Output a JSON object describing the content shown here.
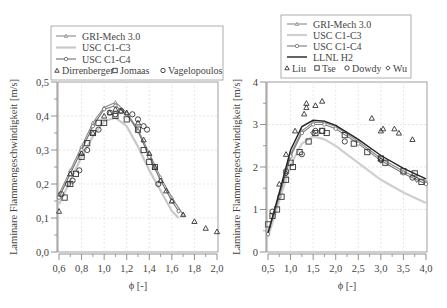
{
  "chart_data": [
    {
      "type": "line",
      "title": "",
      "xlabel": "ϕ [-]",
      "ylabel": "Laminare Flammengeschwindigkeit [m/s]",
      "xlim": [
        0.6,
        2.0
      ],
      "ylim": [
        0.0,
        0.5
      ],
      "xticks": [
        "0,6",
        "0,8",
        "1,0",
        "1,2",
        "1,4",
        "1,6",
        "1,8",
        "2,0"
      ],
      "yticks": [
        "0,0",
        "0,1",
        "0,2",
        "0,3",
        "0,4",
        "0,5"
      ],
      "grid": true,
      "legend_position": "top",
      "legend": [
        "GRI-Mech 3.0",
        "USC C1-C3",
        "USC C1-C4",
        "Dirrenberger",
        "Jomaas",
        "Vagelopoulos"
      ],
      "series": [
        {
          "name": "GRI-Mech 3.0",
          "kind": "line",
          "marker": "triangle",
          "color": "#8a8a8a",
          "x": [
            0.6,
            0.7,
            0.8,
            0.9,
            1.0,
            1.1,
            1.2,
            1.3,
            1.4,
            1.5,
            1.6,
            1.7
          ],
          "y": [
            0.17,
            0.24,
            0.31,
            0.38,
            0.425,
            0.44,
            0.41,
            0.36,
            0.29,
            0.22,
            0.16,
            0.11
          ]
        },
        {
          "name": "USC C1-C3",
          "kind": "line",
          "marker": "none",
          "color": "#c8c8c8",
          "x": [
            0.6,
            0.7,
            0.8,
            0.9,
            1.0,
            1.1,
            1.2,
            1.3,
            1.4,
            1.5,
            1.6,
            1.66
          ],
          "y": [
            0.14,
            0.21,
            0.28,
            0.34,
            0.385,
            0.395,
            0.37,
            0.31,
            0.24,
            0.18,
            0.12,
            0.1
          ]
        },
        {
          "name": "USC C1-C4",
          "kind": "line",
          "marker": "circle",
          "color": "#6f6f6f",
          "x": [
            0.6,
            0.7,
            0.8,
            0.9,
            1.0,
            1.1,
            1.2,
            1.3,
            1.4,
            1.5,
            1.6,
            1.66
          ],
          "y": [
            0.16,
            0.23,
            0.3,
            0.37,
            0.42,
            0.43,
            0.405,
            0.355,
            0.28,
            0.21,
            0.15,
            0.12
          ]
        },
        {
          "name": "Dirrenberger",
          "kind": "scatter",
          "marker": "triangle",
          "x": [
            0.6,
            0.7,
            0.8,
            0.9,
            1.0,
            1.05,
            1.1,
            1.15,
            1.2,
            1.3,
            1.35,
            1.4,
            1.45,
            1.5,
            1.55,
            1.6,
            1.7,
            1.8,
            1.9,
            2.0
          ],
          "y": [
            0.12,
            0.23,
            0.29,
            0.35,
            0.4,
            0.41,
            0.42,
            0.415,
            0.41,
            0.38,
            0.33,
            0.29,
            0.25,
            0.21,
            0.18,
            0.15,
            0.11,
            0.09,
            0.07,
            0.06
          ]
        },
        {
          "name": "Jomaas",
          "kind": "scatter",
          "marker": "square",
          "x": [
            0.65,
            0.7,
            0.75,
            0.8,
            0.85,
            0.9,
            0.95,
            1.0,
            1.1,
            1.2,
            1.3,
            1.35,
            1.4,
            1.45
          ],
          "y": [
            0.16,
            0.2,
            0.23,
            0.28,
            0.32,
            0.35,
            0.38,
            0.38,
            0.4,
            0.39,
            0.36,
            0.3,
            0.265,
            0.25
          ]
        },
        {
          "name": "Vagelopoulos",
          "kind": "scatter",
          "marker": "circle",
          "x": [
            0.62,
            0.68,
            0.72,
            0.78,
            0.85,
            0.95,
            1.05,
            1.1,
            1.15,
            1.25,
            1.3,
            1.35,
            1.38,
            1.48
          ],
          "y": [
            0.17,
            0.2,
            0.21,
            0.24,
            0.3,
            0.36,
            0.41,
            0.405,
            0.415,
            0.405,
            0.39,
            0.37,
            0.36,
            0.2
          ]
        }
      ]
    },
    {
      "type": "line",
      "title": "",
      "xlabel": "ϕ [-]",
      "ylabel": "Laminare Flammengeschwindigkeit [m/s]",
      "xlim": [
        0.5,
        4.0
      ],
      "ylim": [
        0,
        4
      ],
      "xticks": [
        "0,5",
        "1,0",
        "1,5",
        "2,0",
        "2,5",
        "3,0",
        "3,5",
        "4,0"
      ],
      "yticks": [
        "0",
        "1",
        "2",
        "3",
        "4"
      ],
      "grid": true,
      "legend_position": "top",
      "legend": [
        "GRI-Mech 3.0",
        "USC C1-C3",
        "USC C1-C4",
        "LLNL H2",
        "Liu",
        "Tse",
        "Dowdy",
        "Wu"
      ],
      "series": [
        {
          "name": "GRI-Mech 3.0",
          "kind": "line",
          "marker": "triangle",
          "color": "#8a8a8a",
          "x": [
            0.5,
            0.75,
            1.0,
            1.25,
            1.5,
            1.75,
            2.0,
            2.5,
            3.0,
            3.5,
            4.0
          ],
          "y": [
            0.45,
            1.35,
            2.3,
            2.85,
            3.05,
            3.05,
            2.95,
            2.6,
            2.2,
            1.9,
            1.65
          ]
        },
        {
          "name": "USC C1-C3",
          "kind": "line",
          "marker": "none",
          "color": "#cfcfcf",
          "x": [
            0.5,
            0.75,
            1.0,
            1.25,
            1.5,
            1.75,
            2.0,
            2.5,
            3.0,
            3.5,
            4.0
          ],
          "y": [
            0.35,
            1.2,
            2.05,
            2.55,
            2.72,
            2.65,
            2.5,
            2.1,
            1.7,
            1.4,
            1.15
          ]
        },
        {
          "name": "USC C1-C4",
          "kind": "line",
          "marker": "circle",
          "color": "#7a7a7a",
          "x": [
            0.5,
            0.75,
            1.0,
            1.25,
            1.5,
            1.75,
            2.0,
            2.5,
            3.0,
            3.5,
            4.0
          ],
          "y": [
            0.42,
            1.3,
            2.25,
            2.8,
            3.0,
            3.0,
            2.9,
            2.55,
            2.15,
            1.85,
            1.6
          ]
        },
        {
          "name": "LLNL H2",
          "kind": "line",
          "marker": "none",
          "color": "#222222",
          "x": [
            0.5,
            0.75,
            1.0,
            1.25,
            1.5,
            1.75,
            2.0,
            2.5,
            3.0,
            3.5,
            4.0
          ],
          "y": [
            0.45,
            1.4,
            2.4,
            2.95,
            3.1,
            3.08,
            2.98,
            2.65,
            2.27,
            1.97,
            1.72
          ]
        },
        {
          "name": "Liu",
          "kind": "scatter",
          "marker": "triangle",
          "x": [
            0.75,
            0.9,
            1.1,
            1.3,
            1.35,
            1.35,
            1.55,
            1.7,
            2.8,
            3.0,
            3.05,
            3.3,
            3.4,
            3.7
          ],
          "y": [
            1.6,
            2.3,
            2.85,
            3.25,
            3.4,
            3.5,
            3.45,
            3.55,
            3.15,
            2.85,
            2.9,
            2.9,
            2.8,
            2.65
          ]
        },
        {
          "name": "Tse",
          "kind": "scatter",
          "marker": "square",
          "x": [
            0.5,
            0.6,
            0.7,
            0.8,
            0.9,
            1.0,
            1.05,
            1.2,
            1.4,
            1.55,
            1.7,
            1.8,
            2.2,
            2.4,
            2.7,
            3.0,
            3.1,
            3.5,
            3.75,
            3.9
          ],
          "y": [
            0.65,
            0.85,
            1.0,
            1.3,
            1.7,
            2.1,
            2.0,
            2.35,
            2.6,
            2.8,
            2.85,
            2.8,
            2.75,
            2.55,
            2.35,
            2.2,
            2.1,
            1.9,
            1.85,
            1.65
          ]
        },
        {
          "name": "Dowdy",
          "kind": "scatter",
          "marker": "circle",
          "x": [
            0.6,
            0.9,
            1.25,
            1.55,
            1.7,
            2.2,
            3.0,
            3.7
          ],
          "y": [
            0.95,
            1.9,
            2.3,
            2.85,
            2.85,
            2.6,
            2.2,
            1.75
          ]
        },
        {
          "name": "Wu",
          "kind": "scatter",
          "marker": "diamond",
          "x": [
            0.9,
            1.5,
            3.0,
            3.8
          ],
          "y": [
            1.85,
            2.8,
            2.15,
            1.7
          ]
        }
      ]
    }
  ],
  "charts": {
    "left": {
      "legend": {
        "lines": [
          "GRI-Mech 3.0",
          "USC C1-C3",
          "USC C1-C4"
        ],
        "markers": [
          "Dirrenberger",
          "Jomaas",
          "Vagelopoulos"
        ]
      },
      "ylabel": "Laminare Flammengeschwindigkeit [m/s]",
      "xlabel": "ϕ [-]",
      "yticks": [
        "0,0",
        "0,1",
        "0,2",
        "0,3",
        "0,4",
        "0,5"
      ],
      "xticks": [
        "0,6",
        "0,8",
        "1,0",
        "1,2",
        "1,4",
        "1,6",
        "1,8",
        "2,0"
      ]
    },
    "right": {
      "legend": {
        "lines": [
          "GRI-Mech 3.0",
          "USC C1-C3",
          "USC C1-C4",
          "LLNL H2"
        ],
        "markers": [
          "Liu",
          "Tse",
          "Dowdy",
          "Wu"
        ]
      },
      "ylabel": "Laminare Flammengeschwindigkeit [m/s]",
      "xlabel": "ϕ [-]",
      "yticks": [
        "0",
        "1",
        "2",
        "3",
        "4"
      ],
      "xticks": [
        "0,5",
        "1,0",
        "1,5",
        "2,0",
        "2,5",
        "3,0",
        "3,5",
        "4,0"
      ]
    }
  }
}
